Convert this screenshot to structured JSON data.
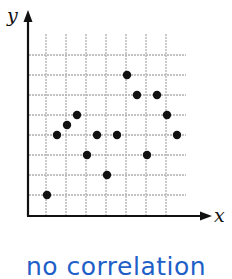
{
  "chart_data": {
    "type": "scatter",
    "title": "",
    "xlabel": "x",
    "ylabel": "y",
    "caption": "no correlation",
    "grid": true,
    "xlim": [
      0,
      9
    ],
    "ylim": [
      0,
      9
    ],
    "points": [
      {
        "x": 1.0,
        "y": 1.0
      },
      {
        "x": 1.5,
        "y": 4.0
      },
      {
        "x": 2.0,
        "y": 4.5
      },
      {
        "x": 2.5,
        "y": 5.0
      },
      {
        "x": 3.0,
        "y": 3.0
      },
      {
        "x": 3.5,
        "y": 4.0
      },
      {
        "x": 4.0,
        "y": 2.0
      },
      {
        "x": 4.5,
        "y": 4.0
      },
      {
        "x": 5.0,
        "y": 7.0
      },
      {
        "x": 5.5,
        "y": 6.0
      },
      {
        "x": 6.0,
        "y": 3.0
      },
      {
        "x": 6.5,
        "y": 6.0
      },
      {
        "x": 7.0,
        "y": 5.0
      },
      {
        "x": 7.5,
        "y": 4.0
      }
    ],
    "colors": {
      "points": "#111111",
      "grid": "#b0b0b0",
      "axis": "#111111",
      "caption": "#1f5fc8"
    }
  }
}
